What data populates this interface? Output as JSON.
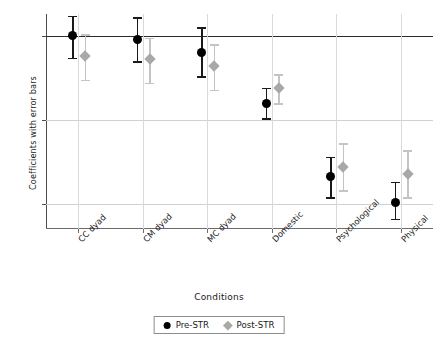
{
  "chart_data": {
    "type": "scatter",
    "title": "",
    "xlabel": "Conditions",
    "ylabel": "Coefficients with error bars",
    "categories": [
      "CC dyad",
      "CM dyad",
      "MC dyad",
      "Domestic",
      "Psychological",
      "Physical"
    ],
    "ylim": [
      -1.15,
      0.13
    ],
    "yticks": [
      0,
      -0.5,
      -1
    ],
    "ytick_labels": [
      "0",
      "-0.5",
      "-1"
    ],
    "grid": "both",
    "legend_position": "bottom-center",
    "zero_reference_line": 0,
    "series": [
      {
        "name": "Pre-STR",
        "marker": "circle",
        "color": "#000000",
        "values": [
          0.0,
          -0.02,
          -0.1,
          -0.4,
          -0.84,
          -0.99
        ],
        "error_low": [
          -0.13,
          -0.15,
          -0.24,
          -0.49,
          -0.96,
          -1.09
        ],
        "error_high": [
          0.12,
          0.11,
          0.05,
          -0.31,
          -0.72,
          -0.87
        ]
      },
      {
        "name": "Post-STR",
        "marker": "diamond",
        "color": "#a8a8a8",
        "values": [
          -0.12,
          -0.14,
          -0.18,
          -0.31,
          -0.78,
          -0.82
        ],
        "error_low": [
          -0.26,
          -0.28,
          -0.32,
          -0.4,
          -0.92,
          -0.96
        ],
        "error_high": [
          0.01,
          -0.01,
          -0.05,
          -0.23,
          -0.64,
          -0.68
        ]
      }
    ]
  },
  "axes": {
    "ylabel": "Coefficients with error bars",
    "xlabel": "Conditions"
  },
  "legend": {
    "items": [
      {
        "label": "Pre-STR",
        "marker": "circle-marker-icon"
      },
      {
        "label": "Post-STR",
        "marker": "diamond-marker-icon"
      }
    ]
  }
}
